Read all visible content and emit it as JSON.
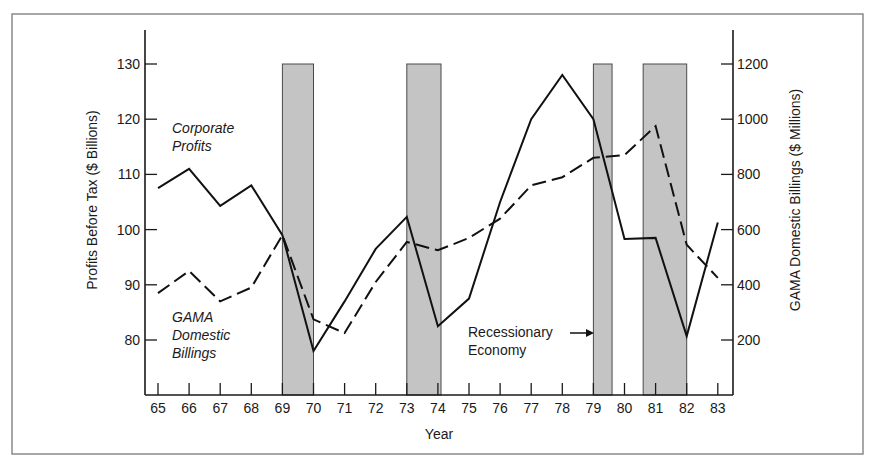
{
  "chart_data": {
    "type": "line",
    "title": "",
    "xlabel": "Year",
    "ylabel": "Profits Before Tax ($ Billions)",
    "y2label": "GAMA Domestic Billings ($ Millions)",
    "x": [
      65,
      66,
      67,
      68,
      69,
      70,
      71,
      72,
      73,
      74,
      75,
      76,
      77,
      78,
      79,
      80,
      81,
      82,
      83
    ],
    "x_tick_labels": [
      "65",
      "66",
      "67",
      "68",
      "69",
      "70",
      "71",
      "72",
      "73",
      "74",
      "75",
      "76",
      "77",
      "78",
      "79",
      "80",
      "81",
      "82",
      "83"
    ],
    "ylim": [
      70,
      135
    ],
    "y_ticks": [
      80,
      90,
      100,
      110,
      120,
      130
    ],
    "y2lim": [
      0,
      1300
    ],
    "y2_ticks": [
      200,
      400,
      600,
      800,
      1000,
      1200
    ],
    "grid": false,
    "series": [
      {
        "name": "Corporate Profits",
        "axis": "left",
        "style": "solid",
        "values": [
          107.5,
          111,
          104.3,
          108,
          99,
          78,
          87,
          96.5,
          102.3,
          82.5,
          87.5,
          105,
          120,
          128,
          120,
          98.3,
          98.5,
          80.7,
          101.3
        ]
      },
      {
        "name": "GAMA Domestic Billings",
        "axis": "right",
        "style": "dashed",
        "values": [
          370,
          450,
          340,
          390,
          580,
          275,
          225,
          410,
          555,
          525,
          570,
          640,
          760,
          790,
          860,
          870,
          975,
          545,
          425
        ]
      }
    ],
    "recession_periods": [
      {
        "start": 69,
        "end": 70
      },
      {
        "start": 73,
        "end": 74.1
      },
      {
        "start": 79,
        "end": 79.6
      },
      {
        "start": 80.6,
        "end": 82
      }
    ],
    "annotations": [
      {
        "text": [
          "Corporate",
          "Profits"
        ],
        "series": "Corporate Profits"
      },
      {
        "text": [
          "GAMA",
          "Domestic",
          "Billings"
        ],
        "series": "GAMA Domestic Billings"
      },
      {
        "text": [
          "Recessionary",
          "Economy"
        ],
        "arrow_to": "recession bar 79"
      }
    ],
    "legend_position": "inline annotations"
  },
  "labels": {
    "xlabel": "Year",
    "ylabel": "Profits Before Tax ($ Billions)",
    "y2label": "GAMA Domestic Billings ($ Millions)",
    "profits_line1": "Corporate",
    "profits_line2": "Profits",
    "billings_line1": "GAMA",
    "billings_line2": "Domestic",
    "billings_line3": "Billings",
    "recession_line1": "Recessionary",
    "recession_line2": "Economy"
  },
  "colors": {
    "line": "#111111",
    "recession_fill": "#c4c4c4",
    "frame": "#8a8a8a"
  }
}
